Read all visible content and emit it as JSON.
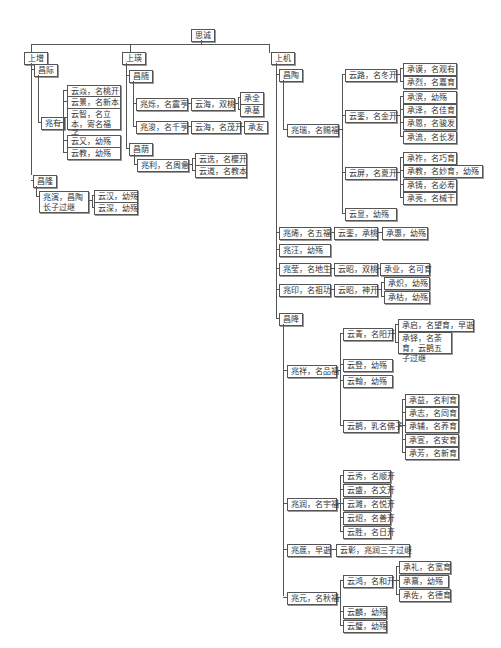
{
  "root": "思诚",
  "branches": {
    "shangzeng": {
      "label": "上增",
      "changji": {
        "label": "昌际",
        "zhaoyou": {
          "label": "兆有",
          "children": [
            "云焱，名桃开",
            "云景，名新本",
            "云智，名立本，寄名福子",
            "云又，幼殇",
            "云教，幼殇"
          ]
        }
      },
      "changlong": {
        "label": "昌隆",
        "zhaoyan": {
          "label": "兆演，昌陶长子过继",
          "children": [
            "云汉，幼殇",
            "云深，幼殇"
          ]
        }
      }
    },
    "shangying": {
      "label": "上瑛",
      "changsui": {
        "label": "昌随",
        "zhaoshuo": {
          "label": "兆烁，名震亨",
          "yunhai": "云海，双桃",
          "children": [
            "承全",
            "承基"
          ]
        },
        "zhaojun": {
          "label": "兆浚，名千亨",
          "yunhai": "云海，名茂开",
          "child": "承友"
        }
      },
      "changyin": {
        "label": "昌荫",
        "zhaoli": {
          "label": "兆利，名周惫",
          "children": [
            "云迭，名樱开",
            "云道，名教本"
          ]
        }
      }
    },
    "shangji": {
      "label": "上机",
      "changtao": {
        "label": "昌陶",
        "zhaorui": {
          "label": "兆瑞，名赐福",
          "yunlu": {
            "label": "云路，名冬开",
            "children": [
              "承谟，名观有",
              "承烈，名嘉育"
            ]
          },
          "yunluan": {
            "label": "云銮，名金开",
            "children": [
              "承滨，幼殇",
              "承泽，名佳育",
              "承恩，名骏发",
              "承流，名长发"
            ]
          },
          "yunping": {
            "label": "云屏，名夏开",
            "children": [
              "承祚，名巧育",
              "承教，名妙育，幼殇",
              "承铸，名必寿",
              "承亮，名械干"
            ]
          },
          "yunxian": "云显，幼殇"
        },
        "zhaoxi": {
          "label": "兆烯，名五福",
          "yun": "云銮，承桃",
          "cheng": "承惠，幼殇"
        },
        "zhaowang": "兆汪，幼殇",
        "zhaoying": {
          "label": "兆莹，名地生",
          "yun": "云昭，双桃",
          "cheng": "承业，名可育"
        },
        "zhaoyin": {
          "label": "兆印，名祖功",
          "yun": "云昭，神开",
          "children": [
            "承炽，幼殇",
            "承枯，幼殇"
          ]
        }
      },
      "changjiang": {
        "label": "昌降",
        "zhaoxiang": {
          "label": "兆祥，名品福",
          "yunqing": {
            "label": "云青，名阳开",
            "children": [
              "承启，名望育，早逝",
              "承铎，名荼育，云鹊五子过继"
            ]
          },
          "yundeng": "云登，幼殇",
          "yunhan": "云翰，幼殇",
          "yunque": {
            "label": "云鹊，乳名佛子",
            "children": [
              "承益，名利育",
              "承志，名同育",
              "承辅，名养育",
              "承宣，名安育",
              "承芳，名新育"
            ]
          }
        },
        "zhaorun": {
          "label": "兆润，名宇福",
          "children": [
            "云秀，名顺开",
            "云盛，名文开",
            "云濉，名悦开",
            "云炤，名善开",
            "云胜，名日开"
          ]
        },
        "zhaoyu": {
          "label": "兆菧，早逝",
          "child": "云彰，兆润三子过继"
        },
        "zhaoyuan": {
          "label": "兆元，名秋福",
          "yunhong": {
            "label": "云鸿，名和开",
            "children": [
              "承礼，名宽育",
              "承熹，幼殇",
              "承佐，名德育"
            ]
          },
          "others": [
            "云麟，幼殇",
            "云璧，幼殇"
          ]
        }
      }
    }
  }
}
